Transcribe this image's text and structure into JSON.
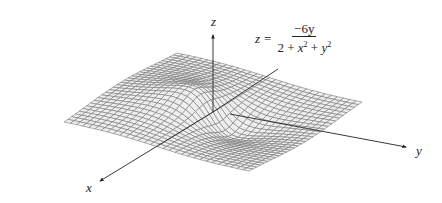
{
  "figure": {
    "type": "3d-surface-wireframe",
    "function": {
      "lhs": "z",
      "equals": "=",
      "numerator": "−6y",
      "denominator_parts": [
        "2 + ",
        "x",
        "2",
        " + ",
        "y",
        "2"
      ],
      "plain_text": "z = −6y / (2 + x^2 + y^2)"
    },
    "axes": {
      "x_label": "x",
      "y_label": "y",
      "z_label": "z"
    },
    "mesh": {
      "grid_lines_per_side": 31,
      "surface_fill": "#eeeeee",
      "line_color": "#6e6e6e",
      "axis_color": "#222222"
    }
  }
}
